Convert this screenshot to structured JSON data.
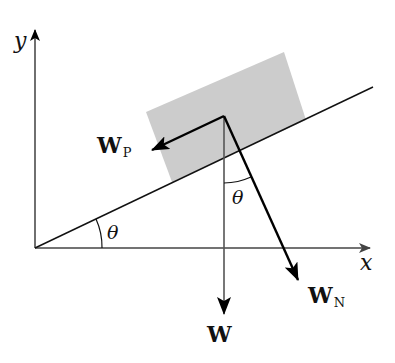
{
  "diagram": {
    "axes": {
      "x_label": "x",
      "y_label": "y"
    },
    "angle_label": "θ",
    "angle_labels": [
      "θ",
      "θ"
    ],
    "vectors": [
      {
        "id": "W",
        "label": "W",
        "subscript": "",
        "description": "weight, vertical downward",
        "color": "#555555"
      },
      {
        "id": "WP",
        "label": "W",
        "subscript": "P",
        "description": "component parallel to incline",
        "color": "#000000"
      },
      {
        "id": "WN",
        "label": "W",
        "subscript": "N",
        "description": "component normal to incline",
        "color": "#000000"
      }
    ],
    "block": {
      "fill": "#cccccc"
    },
    "colors": {
      "axes": "#333333",
      "incline": "#111111",
      "block": "#cccccc"
    }
  }
}
